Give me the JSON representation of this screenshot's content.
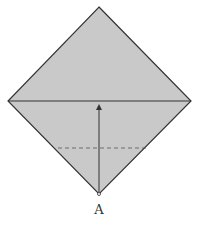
{
  "diagram": {
    "type": "origami-fold",
    "shape": "square-diamond",
    "fill_color": "#c9c9c9",
    "stroke_color": "#333333",
    "point_label": "A",
    "elements": [
      {
        "kind": "diamond",
        "vertices": [
          [
            99,
            7
          ],
          [
            191,
            101
          ],
          [
            99,
            194
          ],
          [
            8,
            101
          ]
        ]
      },
      {
        "kind": "horizontal-diagonal",
        "from": [
          8,
          101
        ],
        "to": [
          191,
          101
        ]
      },
      {
        "kind": "dashed-fold-line",
        "from": [
          58,
          148
        ],
        "to": [
          146,
          148
        ]
      },
      {
        "kind": "arrow",
        "from": [
          99,
          192
        ],
        "to": [
          99,
          105
        ],
        "direction": "up"
      },
      {
        "kind": "point-marker",
        "at": [
          99,
          194
        ]
      }
    ]
  }
}
